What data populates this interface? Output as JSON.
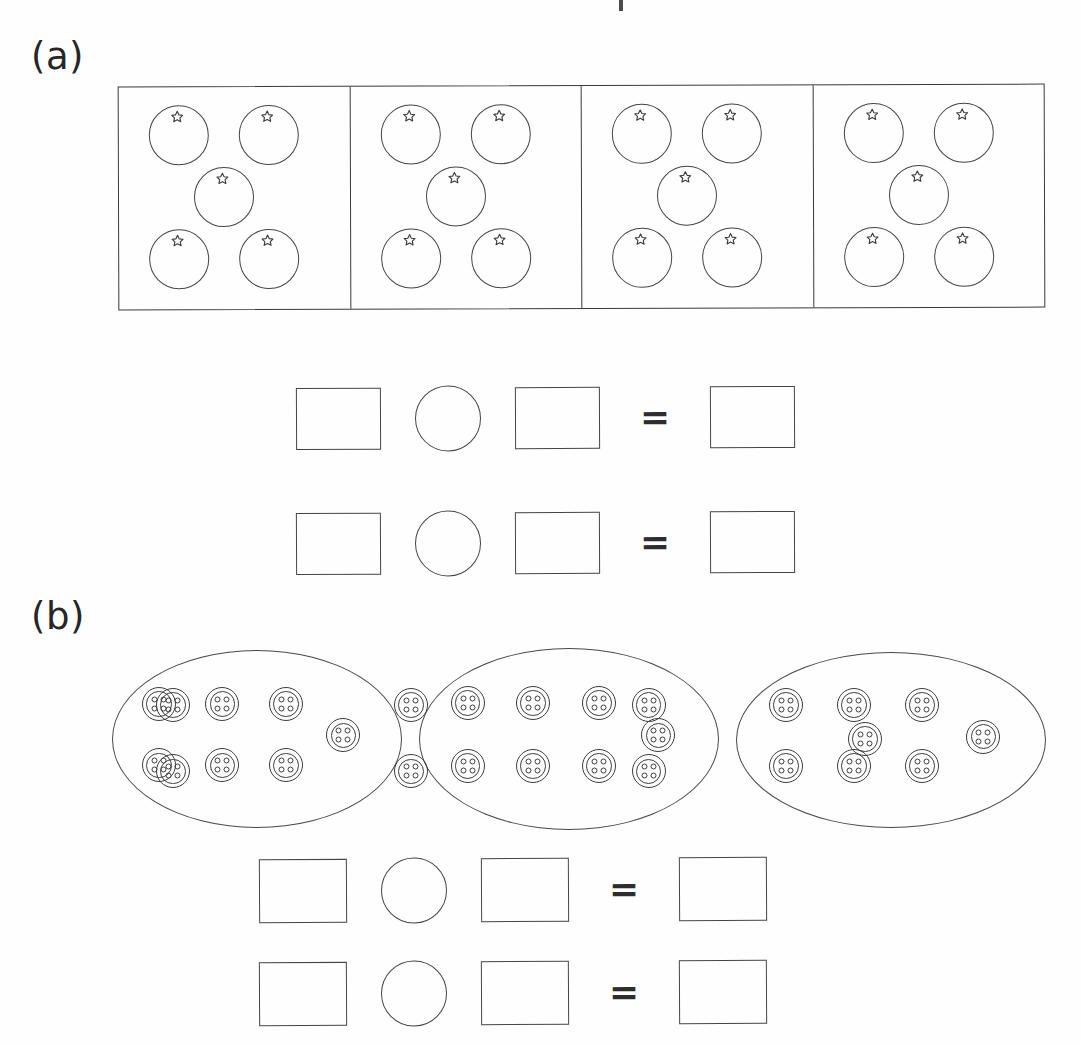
{
  "page": {
    "background_color": "#fefefe",
    "ink_color": "#3a3a3a"
  },
  "sections": [
    {
      "id": "a",
      "label": "(a)",
      "illustration": {
        "kind": "framed-panels",
        "panel_count": 4,
        "items_per_panel": 5,
        "item_name": "circle-with-star",
        "item_arrangement": "quincunx",
        "total_items": 20,
        "panel_positions": [
          "top-left",
          "top-right",
          "center",
          "bottom-left",
          "bottom-right"
        ]
      },
      "equations": [
        {
          "slots": [
            "blank-box",
            "blank-operator-circle",
            "blank-box",
            "equals",
            "blank-box"
          ],
          "equals_symbol": "="
        },
        {
          "slots": [
            "blank-box",
            "blank-operator-circle",
            "blank-box",
            "equals",
            "blank-box"
          ],
          "equals_symbol": "="
        }
      ]
    },
    {
      "id": "b",
      "label": "(b)",
      "illustration": {
        "kind": "ellipse-groups",
        "group_count": 3,
        "items_per_group": 7,
        "item_name": "button",
        "item_detail": "double-ring button with four holes",
        "total_items": 21,
        "item_arrangement": "3 top, 3 bottom, 1 right"
      },
      "equations": [
        {
          "slots": [
            "blank-box",
            "blank-operator-circle",
            "blank-box",
            "equals",
            "blank-box"
          ],
          "equals_symbol": "="
        },
        {
          "slots": [
            "blank-box",
            "blank-operator-circle",
            "blank-box",
            "equals",
            "blank-box"
          ],
          "equals_symbol": "="
        }
      ]
    }
  ],
  "glyphs": {
    "equals": "=",
    "star": "star-outline",
    "button": "button-four-hole"
  }
}
